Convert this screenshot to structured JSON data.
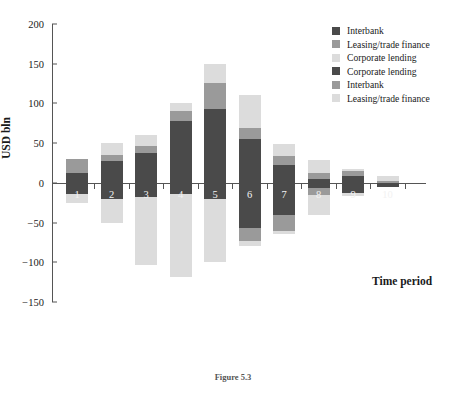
{
  "chart_data": {
    "type": "bar",
    "title": "",
    "subtitle": "",
    "xlabel": "Time period",
    "ylabel": "USD bln",
    "ylim": [
      -150,
      200
    ],
    "yticks": [
      200,
      150,
      100,
      50,
      0,
      -50,
      -100,
      -150
    ],
    "grid": false,
    "stacked": true,
    "legend_position": "top-right",
    "categories": [
      "1",
      "2",
      "3",
      "4",
      "5",
      "6",
      "7",
      "8",
      "9",
      "10"
    ],
    "legend": [
      {
        "label": "Interbank",
        "color": "#4a4a4a",
        "side": "positive"
      },
      {
        "label": "Leasing/trade finance",
        "color": "#9a9a9a",
        "side": "positive"
      },
      {
        "label": "Corporate lending",
        "color": "#dcdcdc",
        "side": "positive"
      },
      {
        "label": "Corporate lending",
        "color": "#4a4a4a",
        "side": "negative"
      },
      {
        "label": "Interbank",
        "color": "#9a9a9a",
        "side": "negative"
      },
      {
        "label": "Leasing/trade finance",
        "color": "#dcdcdc",
        "side": "negative"
      }
    ],
    "series": [
      {
        "name": "Interbank",
        "color": "#4a4a4a",
        "side": "positive",
        "values": [
          12,
          28,
          37,
          78,
          93,
          55,
          22,
          5,
          9,
          0
        ]
      },
      {
        "name": "Leasing/trade finance",
        "color": "#9a9a9a",
        "side": "positive",
        "values": [
          18,
          7,
          10,
          12,
          33,
          14,
          12,
          7,
          6,
          2
        ]
      },
      {
        "name": "Corporate lending",
        "color": "#dcdcdc",
        "side": "positive",
        "values": [
          0,
          15,
          13,
          10,
          24,
          41,
          15,
          17,
          3,
          7
        ]
      },
      {
        "name": "Corporate lending",
        "color": "#4a4a4a",
        "side": "negative",
        "values": [
          -14,
          -20,
          -18,
          -14,
          -20,
          -57,
          -40,
          -6,
          -13,
          -5
        ]
      },
      {
        "name": "Interbank",
        "color": "#9a9a9a",
        "side": "negative",
        "values": [
          0,
          0,
          0,
          0,
          0,
          -16,
          -21,
          -9,
          0,
          0
        ]
      },
      {
        "name": "Leasing/trade finance",
        "color": "#dcdcdc",
        "side": "negative",
        "values": [
          -11,
          -31,
          -85,
          -105,
          -80,
          -6,
          -3,
          -26,
          -4,
          0
        ]
      }
    ],
    "positive_totals": [
      30,
      50,
      60,
      100,
      150,
      110,
      49,
      29,
      18,
      9
    ],
    "negative_totals": [
      -25,
      -51,
      -103,
      -119,
      -100,
      -79,
      -64,
      -41,
      -17,
      -5
    ],
    "x_tick_count": 10,
    "axis_color": "#555555"
  },
  "caption": {
    "text": "Figure 5.3  ",
    "visible": false
  },
  "colors": {
    "dark": "#4a4a4a",
    "medium": "#9a9a9a",
    "light": "#dcdcdc",
    "axis": "#555555",
    "background": "#ffffff",
    "text": "#1a1a1a"
  }
}
